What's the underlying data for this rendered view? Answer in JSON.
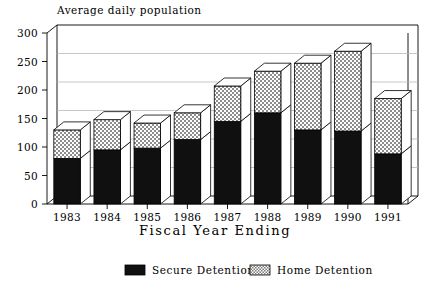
{
  "chart_data": {
    "type": "bar",
    "subtype": "stacked-3d-column",
    "title": "Average daily population",
    "xlabel": "Fiscal Year Ending",
    "ylabel": "",
    "categories": [
      "1983",
      "1984",
      "1985",
      "1986",
      "1987",
      "1988",
      "1989",
      "1990",
      "1991"
    ],
    "series": [
      {
        "name": "Secure Detention",
        "fill": "solid-black",
        "color": "#101010",
        "values": [
          80,
          95,
          98,
          113,
          145,
          160,
          130,
          128,
          88
        ]
      },
      {
        "name": "Home Detention",
        "fill": "checkered-hatch",
        "color": "#c9c9c9",
        "values": [
          50,
          53,
          44,
          47,
          62,
          73,
          117,
          140,
          97
        ]
      }
    ],
    "totals": [
      130,
      148,
      142,
      160,
      207,
      233,
      247,
      268,
      185
    ],
    "ylim": [
      0,
      300
    ],
    "yticks": [
      0,
      50,
      100,
      150,
      200,
      250,
      300
    ],
    "ytick_labels": [
      "0",
      "50",
      "100",
      "150",
      "200",
      "250",
      "300"
    ],
    "grid": true,
    "grid_axis": "y",
    "legend_position": "bottom",
    "legend_entries": [
      "Secure Detention",
      "Home Detention"
    ]
  },
  "axes": {
    "y_tick_labels": [
      "300",
      "250",
      "200",
      "150",
      "100",
      "50",
      "0"
    ],
    "x_tick_labels": [
      "1983",
      "1984",
      "1985",
      "1986",
      "1987",
      "1988",
      "1989",
      "1990",
      "1991"
    ],
    "x_axis_title": "Fiscal Year Ending",
    "plot_title": "Average daily population"
  },
  "legend": {
    "items": [
      {
        "label": "Secure Detention",
        "swatch": "solid-black"
      },
      {
        "label": "Home Detention",
        "swatch": "checkered-hatch"
      }
    ]
  },
  "colors": {
    "background": "#ffffff",
    "axis": "#000000",
    "grid": "#b9b9b9",
    "secure_detention": "#101010",
    "home_detention": "#c9c9c9",
    "bar_side": "#ffffff",
    "bar_top": "#ffffff"
  }
}
